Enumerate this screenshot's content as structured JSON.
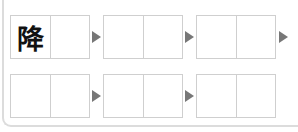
{
  "puzzle": {
    "type": "idiom-chain",
    "rows": [
      {
        "pairs": [
          {
            "cells": [
              "降",
              ""
            ]
          },
          {
            "cells": [
              "",
              ""
            ]
          },
          {
            "cells": [
              "",
              ""
            ]
          }
        ],
        "trailing_arrow": true
      },
      {
        "pairs": [
          {
            "cells": [
              "",
              ""
            ]
          },
          {
            "cells": [
              "",
              ""
            ]
          },
          {
            "cells": [
              "",
              ""
            ]
          }
        ],
        "trailing_arrow": false
      }
    ],
    "icons": {
      "arrow": "play-triangle-icon"
    },
    "colors": {
      "box_border": "#cfcfcf",
      "arrow": "#777777",
      "frame": "#dcdcdc",
      "text": "#111111"
    }
  }
}
